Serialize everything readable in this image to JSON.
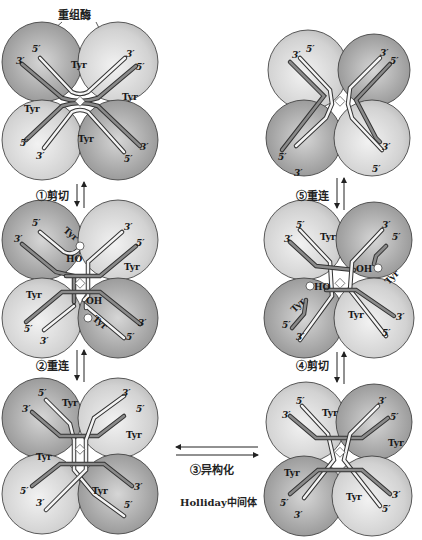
{
  "title": "重组酶",
  "steps": [
    {
      "id": 1,
      "label": "①剪切"
    },
    {
      "id": 2,
      "label": "②重连"
    },
    {
      "id": 3,
      "label": "③异构化"
    },
    {
      "id": 4,
      "label": "④剪切"
    },
    {
      "id": 5,
      "label": "⑤重连"
    }
  ],
  "intermediate_caption": "Holliday中间体",
  "strand_labels": {
    "five_prime": "5′",
    "three_prime": "3′"
  },
  "residue_label": "Tyr",
  "hydroxyl_labels": {
    "left": "HO",
    "right": "OH"
  },
  "phosphate_label": "P",
  "panels": [
    {
      "name": "panel-top-left",
      "stage": "synapsis"
    },
    {
      "name": "panel-middle-left",
      "stage": "cleavage"
    },
    {
      "name": "panel-bottom-left",
      "stage": "holliday-junction"
    },
    {
      "name": "panel-bottom-right",
      "stage": "holliday-junction-isomerized"
    },
    {
      "name": "panel-middle-right",
      "stage": "second-cleavage"
    },
    {
      "name": "panel-top-right",
      "stage": "product"
    }
  ],
  "colors": {
    "circle_light": "#e2e2e2",
    "circle_dark": "#9c9c9c",
    "strand_fill": "#f4f4f4",
    "strand_outline": "#333333",
    "strand_dark": "#8a8a8a",
    "background": "#ffffff"
  }
}
